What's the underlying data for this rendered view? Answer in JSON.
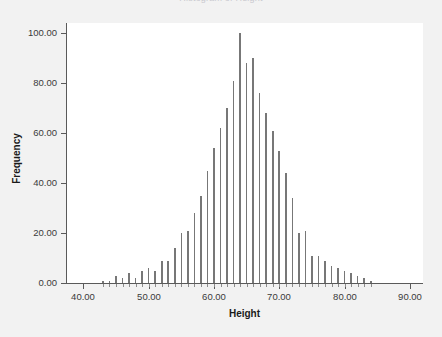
{
  "chart_data": {
    "type": "bar",
    "title": "Histogram of Height",
    "xlabel": "Height",
    "ylabel": "Frequency",
    "xlim": [
      37.5,
      92.0
    ],
    "ylim": [
      0,
      104
    ],
    "grid": false,
    "legend": null,
    "x_ticks": [
      40,
      50,
      60,
      70,
      80,
      90
    ],
    "x_tick_labels": [
      "40.00",
      "50.00",
      "60.00",
      "70.00",
      "80.00",
      "90.00"
    ],
    "y_ticks": [
      0,
      20,
      40,
      60,
      80,
      100
    ],
    "y_tick_labels": [
      "0.00",
      "20.00",
      "40.00",
      "60.00",
      "80.00",
      "100.00"
    ],
    "bar_color": "#777777",
    "x": [
      43,
      44,
      45,
      46,
      47,
      48,
      49,
      50,
      51,
      52,
      53,
      54,
      55,
      56,
      57,
      58,
      59,
      60,
      61,
      62,
      63,
      64,
      65,
      66,
      67,
      68,
      69,
      70,
      71,
      72,
      73,
      74,
      75,
      76,
      77,
      78,
      79,
      80,
      81,
      82,
      83,
      84
    ],
    "values": [
      1,
      1,
      3,
      2,
      4,
      2,
      5,
      6,
      5,
      9,
      9,
      14,
      20,
      21,
      28,
      35,
      45,
      54,
      62,
      70,
      81,
      100,
      88,
      90,
      76,
      68,
      61,
      53,
      44,
      34,
      20,
      21,
      11,
      11,
      9,
      7,
      6,
      5,
      4,
      3,
      2,
      1
    ],
    "categories": [
      "43.0",
      "44.0",
      "45.0",
      "46.0",
      "47.0",
      "48.0",
      "49.0",
      "50.0",
      "51.0",
      "52.0",
      "53.0",
      "54.0",
      "55.0",
      "56.0",
      "57.0",
      "58.0",
      "59.0",
      "60.0",
      "61.0",
      "62.0",
      "63.0",
      "64.0",
      "65.0",
      "66.0",
      "67.0",
      "68.0",
      "69.0",
      "70.0",
      "71.0",
      "72.0",
      "73.0",
      "74.0",
      "75.0",
      "76.0",
      "77.0",
      "78.0",
      "79.0",
      "80.0",
      "81.0",
      "82.0",
      "83.0",
      "84.0"
    ]
  }
}
